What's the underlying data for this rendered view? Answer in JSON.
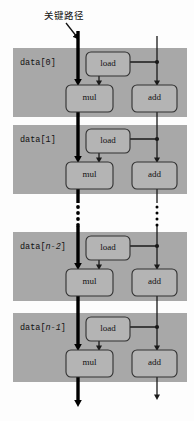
{
  "diagram": {
    "title_annotation": "关键路径",
    "colors": {
      "background": "#fdfdfd",
      "block_fill": "#a8a8a8",
      "node_fill": "#b4b4b4",
      "node_stroke": "#303030",
      "critical_path": "#000000",
      "normal_path": "#1a1a1a"
    },
    "blocks": [
      {
        "label_prefix": "data[",
        "label_index": "0",
        "label_suffix": "]",
        "nodes": [
          {
            "name": "load",
            "label": "load"
          },
          {
            "name": "mul",
            "label": "mul"
          },
          {
            "name": "add",
            "label": "add"
          }
        ]
      },
      {
        "label_prefix": "data[",
        "label_index": "1",
        "label_suffix": "]",
        "nodes": [
          {
            "name": "load",
            "label": "load"
          },
          {
            "name": "mul",
            "label": "mul"
          },
          {
            "name": "add",
            "label": "add"
          }
        ]
      },
      {
        "label_prefix": "data[",
        "label_index": "n-2",
        "label_suffix": "]",
        "label_index_italic": true,
        "nodes": [
          {
            "name": "load",
            "label": "load"
          },
          {
            "name": "mul",
            "label": "mul"
          },
          {
            "name": "add",
            "label": "add"
          }
        ]
      },
      {
        "label_prefix": "data[",
        "label_index": "n-1",
        "label_suffix": "]",
        "label_index_italic": true,
        "nodes": [
          {
            "name": "load",
            "label": "load"
          },
          {
            "name": "mul",
            "label": "mul"
          },
          {
            "name": "add",
            "label": "add"
          }
        ]
      }
    ],
    "ellipsis": {
      "dots": 4,
      "columns": 2
    }
  }
}
